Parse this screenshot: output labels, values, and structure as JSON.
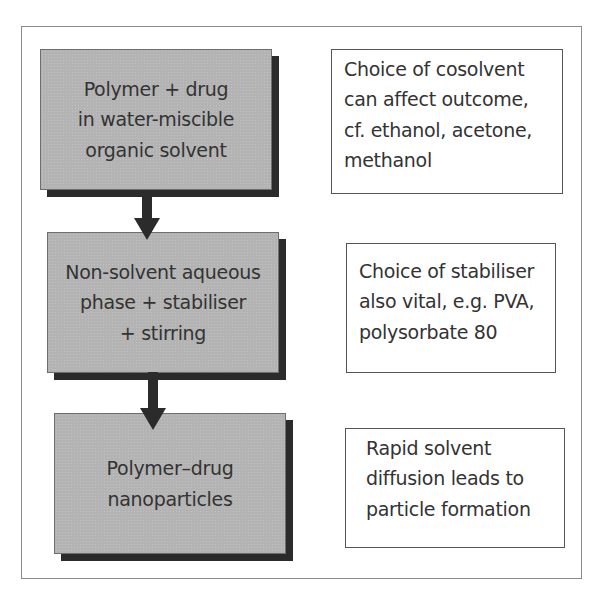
{
  "diagram": {
    "type": "flowchart",
    "direction": "top-to-bottom",
    "steps": [
      {
        "id": "step1",
        "lines": [
          "Polymer + drug",
          "in water-miscible",
          "organic solvent"
        ]
      },
      {
        "id": "step2",
        "lines": [
          "Non-solvent aqueous",
          "phase + stabiliser",
          "+ stirring"
        ]
      },
      {
        "id": "step3",
        "lines": [
          "Polymer–drug",
          "nanoparticles"
        ]
      }
    ],
    "notes": [
      {
        "for": "step1",
        "lines": [
          "Choice of cosolvent",
          "can affect outcome,",
          "cf. ethanol, acetone,",
          "methanol"
        ]
      },
      {
        "for": "step2",
        "lines": [
          "Choice of stabiliser",
          "also vital, e.g. PVA,",
          "polysorbate 80"
        ]
      },
      {
        "for": "step3",
        "lines": [
          "Rapid solvent",
          "diffusion leads to",
          "particle formation"
        ]
      }
    ],
    "arrows": [
      {
        "from": "step1",
        "to": "step2",
        "icon": "down-arrow"
      },
      {
        "from": "step2",
        "to": "step3",
        "icon": "down-arrow"
      }
    ],
    "colors": {
      "step_fill": "#b3b3b3",
      "step_shadow": "#2b2b2b",
      "note_fill": "#ffffff",
      "frame_border": "#8a8a8a",
      "arrow": "#2b2b2b"
    }
  }
}
